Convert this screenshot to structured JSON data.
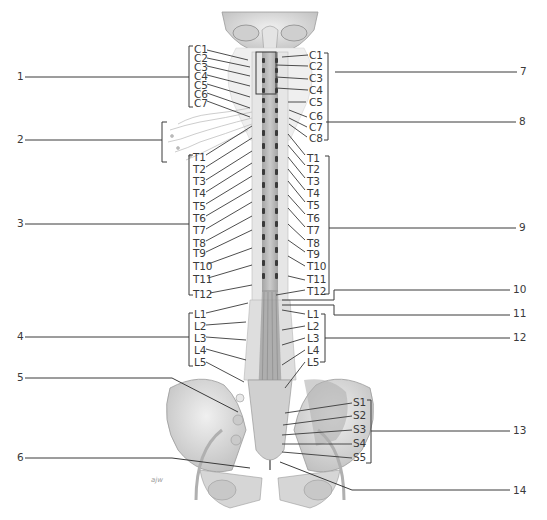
{
  "diagram": {
    "signature": "ajw",
    "left_labels": {
      "cervical": [
        "C1",
        "C2",
        "C3",
        "C4",
        "C5",
        "C6",
        "C7"
      ],
      "thoracic": [
        "T1",
        "T2",
        "T3",
        "T4",
        "T5",
        "T6",
        "T7",
        "T8",
        "T9",
        "T10",
        "T11",
        "T12"
      ],
      "lumbar": [
        "L1",
        "L2",
        "L3",
        "L4",
        "L5"
      ]
    },
    "right_labels": {
      "cervical": [
        "C1",
        "C2",
        "C3",
        "C4",
        "C5",
        "C6",
        "C7",
        "C8"
      ],
      "thoracic": [
        "T1",
        "T2",
        "T3",
        "T4",
        "T5",
        "T6",
        "T7",
        "T8",
        "T9",
        "T10",
        "T11",
        "T12"
      ],
      "lumbar": [
        "L1",
        "L2",
        "L3",
        "L4",
        "L5"
      ],
      "sacral": [
        "S1",
        "S2",
        "S3",
        "S4",
        "S5"
      ]
    },
    "callouts_left": [
      {
        "number": "1",
        "y": 77
      },
      {
        "number": "2",
        "y": 140
      },
      {
        "number": "3",
        "y": 223
      },
      {
        "number": "4",
        "y": 337
      },
      {
        "number": "5",
        "y": 377
      },
      {
        "number": "6",
        "y": 457
      }
    ],
    "callouts_right": [
      {
        "number": "7",
        "y": 71
      },
      {
        "number": "8",
        "y": 121
      },
      {
        "number": "9",
        "y": 226
      },
      {
        "number": "10",
        "y": 289
      },
      {
        "number": "11",
        "y": 313
      },
      {
        "number": "12",
        "y": 337
      },
      {
        "number": "13",
        "y": 430
      },
      {
        "number": "14",
        "y": 490
      }
    ],
    "colors": {
      "line": "#3a3a3a",
      "bone": "#d9d9d9",
      "bone_shadow": "#a8a8a8",
      "cord": "#8c8c8c",
      "background": "#ffffff"
    }
  }
}
